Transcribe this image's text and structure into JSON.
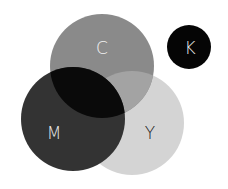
{
  "diagram": {
    "type": "venn",
    "circles": [
      {
        "id": "C",
        "label": "C",
        "color": "#8a8a8a",
        "text_color": "#f2f2f2"
      },
      {
        "id": "M",
        "label": "M",
        "color": "#333333",
        "text_color": "#e8e8e8"
      },
      {
        "id": "Y",
        "label": "Y",
        "color": "#d4d4d4",
        "text_color": "#1a1a1a"
      },
      {
        "id": "K",
        "label": "K",
        "color": "#050505",
        "text_color": "#e8e8e8"
      }
    ],
    "overlaps": {
      "C_M": "#0a0a0a",
      "C_Y": "#a3a3a3",
      "M_Y": "#333333"
    }
  }
}
